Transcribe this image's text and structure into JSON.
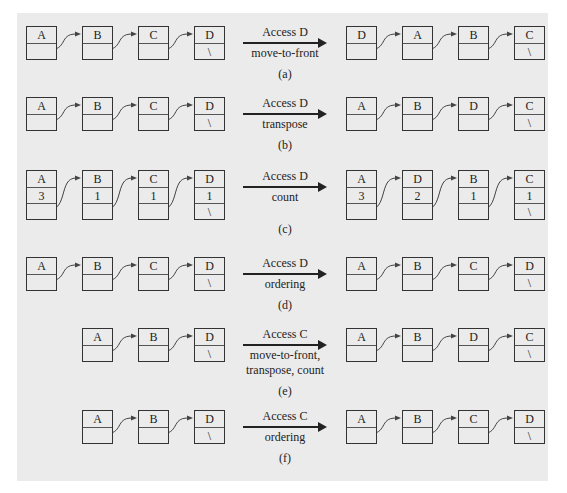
{
  "diagram": {
    "panels": [
      {
        "id": "a",
        "caption": "(a)",
        "op_line1": "Access D",
        "op_line2": "move-to-front",
        "op_line3": "",
        "before": [
          {
            "key": "A"
          },
          {
            "key": "B"
          },
          {
            "key": "C"
          },
          {
            "key": "D",
            "null": "\\"
          }
        ],
        "after": [
          {
            "key": "D"
          },
          {
            "key": "A"
          },
          {
            "key": "B"
          },
          {
            "key": "C",
            "null": "\\"
          }
        ]
      },
      {
        "id": "b",
        "caption": "(b)",
        "op_line1": "Access D",
        "op_line2": "transpose",
        "op_line3": "",
        "before": [
          {
            "key": "A"
          },
          {
            "key": "B"
          },
          {
            "key": "C"
          },
          {
            "key": "D",
            "null": "\\"
          }
        ],
        "after": [
          {
            "key": "A"
          },
          {
            "key": "B"
          },
          {
            "key": "D"
          },
          {
            "key": "C",
            "null": "\\"
          }
        ]
      },
      {
        "id": "c",
        "caption": "(c)",
        "op_line1": "Access D",
        "op_line2": "count",
        "op_line3": "",
        "before": [
          {
            "key": "A",
            "count": "3"
          },
          {
            "key": "B",
            "count": "1"
          },
          {
            "key": "C",
            "count": "1"
          },
          {
            "key": "D",
            "count": "1",
            "null": "\\"
          }
        ],
        "after": [
          {
            "key": "A",
            "count": "3"
          },
          {
            "key": "D",
            "count": "2"
          },
          {
            "key": "B",
            "count": "1"
          },
          {
            "key": "C",
            "count": "1",
            "null": "\\"
          }
        ]
      },
      {
        "id": "d",
        "caption": "(d)",
        "op_line1": "Access D",
        "op_line2": "ordering",
        "op_line3": "",
        "before": [
          {
            "key": "A"
          },
          {
            "key": "B"
          },
          {
            "key": "C"
          },
          {
            "key": "D",
            "null": "\\"
          }
        ],
        "after": [
          {
            "key": "A"
          },
          {
            "key": "B"
          },
          {
            "key": "C"
          },
          {
            "key": "D",
            "null": "\\"
          }
        ]
      },
      {
        "id": "e",
        "caption": "(e)",
        "op_line1": "Access C",
        "op_line2": "move-to-front,",
        "op_line3": "transpose, count",
        "before": [
          {
            "key": "A"
          },
          {
            "key": "B"
          },
          {
            "key": "D",
            "null": "\\"
          }
        ],
        "after": [
          {
            "key": "A"
          },
          {
            "key": "B"
          },
          {
            "key": "D"
          },
          {
            "key": "C",
            "null": "\\"
          }
        ]
      },
      {
        "id": "f",
        "caption": "(f)",
        "op_line1": "Access C",
        "op_line2": "ordering",
        "op_line3": "",
        "before": [
          {
            "key": "A"
          },
          {
            "key": "B"
          },
          {
            "key": "D",
            "null": "\\"
          }
        ],
        "after": [
          {
            "key": "A"
          },
          {
            "key": "B"
          },
          {
            "key": "C"
          },
          {
            "key": "D",
            "null": "\\"
          }
        ]
      }
    ]
  }
}
